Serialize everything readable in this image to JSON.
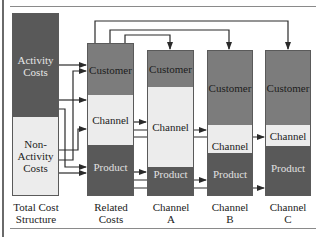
{
  "figure": {
    "type": "cost allocation flow diagram",
    "columns": [
      {
        "id": "total",
        "caption_line1": "Total Cost",
        "caption_line2": "Structure",
        "segments": [
          {
            "label_line1": "Activity",
            "label_line2": "Costs",
            "label_line3": "",
            "shade": "#595959"
          },
          {
            "label_line1": "Non-",
            "label_line2": "Activity",
            "label_line3": "Costs",
            "shade": "#ececec"
          }
        ]
      },
      {
        "id": "related",
        "caption_line1": "Related",
        "caption_line2": "Costs",
        "segments": [
          {
            "label": "Customer",
            "shade": "#7c7c7c"
          },
          {
            "label": "Channel",
            "shade": "#ececec"
          },
          {
            "label": "Product",
            "shade": "#595959"
          }
        ]
      },
      {
        "id": "channel_a",
        "caption_line1": "Channel",
        "caption_line2": "A",
        "segments": [
          {
            "label": "Customer",
            "shade": "#7c7c7c"
          },
          {
            "label": "Channel",
            "shade": "#ececec"
          },
          {
            "label": "Product",
            "shade": "#595959"
          }
        ]
      },
      {
        "id": "channel_b",
        "caption_line1": "Channel",
        "caption_line2": "B",
        "segments": [
          {
            "label": "Customer",
            "shade": "#7c7c7c"
          },
          {
            "label": "Channel",
            "shade": "#ececec"
          },
          {
            "label": "Product",
            "shade": "#595959"
          }
        ]
      },
      {
        "id": "channel_c",
        "caption_line1": "Channel",
        "caption_line2": "C",
        "segments": [
          {
            "label": "Customer",
            "shade": "#7c7c7c"
          },
          {
            "label": "Channel",
            "shade": "#ececec"
          },
          {
            "label": "Product",
            "shade": "#595959"
          }
        ]
      }
    ],
    "flows": [
      {
        "from": "Activity Costs",
        "to": "Related Costs / Customer"
      },
      {
        "from": "Non-Activity Costs",
        "to": "Related Costs / Customer"
      },
      {
        "from": "Activity Costs",
        "to": "Related Costs / Channel"
      },
      {
        "from": "Non-Activity Costs",
        "to": "Related Costs / Channel"
      },
      {
        "from": "Activity Costs",
        "to": "Related Costs / Product"
      },
      {
        "from": "Non-Activity Costs",
        "to": "Related Costs / Product"
      },
      {
        "from": "Related Costs / Customer",
        "to": "Channel A / Customer"
      },
      {
        "from": "Related Costs / Customer",
        "to": "Channel B / Customer"
      },
      {
        "from": "Related Costs / Customer",
        "to": "Channel C / Customer"
      },
      {
        "from": "Related Costs / Channel",
        "to": "Channel A / Channel"
      },
      {
        "from": "Related Costs / Channel",
        "to": "Channel B / Channel"
      },
      {
        "from": "Related Costs / Channel",
        "to": "Channel C / Channel"
      },
      {
        "from": "Related Costs / Product",
        "to": "Channel A / Product"
      },
      {
        "from": "Related Costs / Product",
        "to": "Channel B / Product"
      },
      {
        "from": "Related Costs / Product",
        "to": "Channel C / Product"
      }
    ],
    "colors": {
      "dark": "#595959",
      "mid": "#7c7c7c",
      "light": "#ececec",
      "line": "#2a2a2a"
    }
  }
}
